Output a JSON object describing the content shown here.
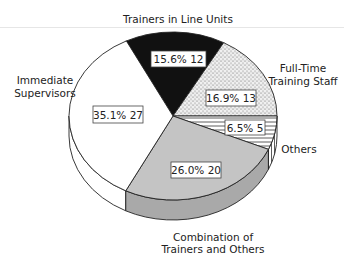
{
  "chart_data": {
    "type": "pie",
    "style": "3d-pie",
    "title": "",
    "slices": [
      {
        "name": "Trainers in Line Units",
        "percent": 15.6,
        "count": 12,
        "fill": "#111111",
        "pattern": "solid-black",
        "value_label": "15.6%  12"
      },
      {
        "name": "Full-Time Training Staff",
        "percent": 16.9,
        "count": 13,
        "fill": "#e8e8e8",
        "pattern": "stipple",
        "value_label": "16.9%  13"
      },
      {
        "name": "Others",
        "percent": 6.5,
        "count": 5,
        "fill": "#ffffff",
        "pattern": "horizontal-lines",
        "value_label": "6.5%  5"
      },
      {
        "name": "Combination of Trainers and Others",
        "percent": 26.0,
        "count": 20,
        "fill": "#bdbdbd",
        "pattern": "solid-gray",
        "value_label": "26.0%  20"
      },
      {
        "name": "Immediate Supervisors",
        "percent": 35.1,
        "count": 27,
        "fill": "#ffffff",
        "pattern": "solid-white",
        "value_label": "35.1%  27"
      }
    ],
    "total": 77,
    "legend": "none (external slice labels)"
  },
  "labels": {
    "line_units": "Trainers in Line Units",
    "fulltime_1": "Full-Time",
    "fulltime_2": "Training Staff",
    "immediate_1": "Immediate",
    "immediate_2": "Supervisors",
    "others": "Others",
    "combo_1": "Combination of",
    "combo_2": "Trainers and Others"
  },
  "values": {
    "line_units": "15.6%  12",
    "fulltime": "16.9%  13",
    "others": "6.5%  5",
    "combo": "26.0%  20",
    "immediate": "35.1%  27"
  }
}
